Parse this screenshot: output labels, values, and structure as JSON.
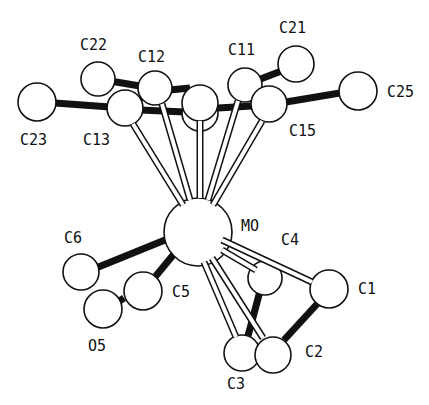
{
  "figure": {
    "type": "ORTEP molecular structure",
    "colors": {
      "ink": "#111111",
      "background": "#ffffff"
    }
  },
  "atoms": [
    {
      "id": "C23",
      "label": "C23",
      "x": 37,
      "y": 102,
      "r": 19,
      "lx": 20,
      "ly": 145
    },
    {
      "id": "C22",
      "label": "C22",
      "x": 98,
      "y": 79,
      "r": 17,
      "lx": 80,
      "ly": 50
    },
    {
      "id": "C12",
      "label": "C12",
      "x": 155,
      "y": 88,
      "r": 17,
      "lx": 138,
      "ly": 62
    },
    {
      "id": "C13",
      "label": "C13",
      "x": 125,
      "y": 108,
      "r": 18,
      "lx": 83,
      "ly": 145
    },
    {
      "id": "C14",
      "label": "",
      "x": 200,
      "y": 103,
      "r": 18,
      "lx": 0,
      "ly": 0
    },
    {
      "id": "C11",
      "label": "C11",
      "x": 245,
      "y": 85,
      "r": 17,
      "lx": 228,
      "ly": 55
    },
    {
      "id": "C21",
      "label": "C21",
      "x": 296,
      "y": 64,
      "r": 18,
      "lx": 279,
      "ly": 33
    },
    {
      "id": "C15",
      "label": "C15",
      "x": 269,
      "y": 104,
      "r": 18,
      "lx": 289,
      "ly": 136
    },
    {
      "id": "C25",
      "label": "C25",
      "x": 358,
      "y": 91,
      "r": 19,
      "lx": 387,
      "ly": 97
    },
    {
      "id": "MO",
      "label": "MO",
      "x": 198,
      "y": 232,
      "r": 34,
      "lx": 241,
      "ly": 231
    },
    {
      "id": "C6",
      "label": "C6",
      "x": 81,
      "y": 272,
      "r": 18,
      "lx": 64,
      "ly": 243
    },
    {
      "id": "C5",
      "label": "C5",
      "x": 143,
      "y": 291,
      "r": 19,
      "lx": 172,
      "ly": 297
    },
    {
      "id": "O5",
      "label": "O5",
      "x": 103,
      "y": 309,
      "r": 19,
      "lx": 88,
      "ly": 351
    },
    {
      "id": "C4",
      "label": "C4",
      "x": 265,
      "y": 278,
      "r": 17,
      "lx": 281,
      "ly": 245
    },
    {
      "id": "C1",
      "label": "C1",
      "x": 329,
      "y": 289,
      "r": 19,
      "lx": 358,
      "ly": 294
    },
    {
      "id": "C3",
      "label": "C3",
      "x": 242,
      "y": 353,
      "r": 18,
      "lx": 227,
      "ly": 389
    },
    {
      "id": "C2",
      "label": "C2",
      "x": 273,
      "y": 355,
      "r": 18,
      "lx": 305,
      "ly": 357
    }
  ],
  "bonds_solid": [
    {
      "from": [
        55,
        103
      ],
      "to": [
        110,
        107
      ]
    },
    {
      "from": [
        110,
        81
      ],
      "to": [
        140,
        86
      ]
    },
    {
      "from": [
        140,
        110
      ],
      "to": [
        185,
        112
      ]
    },
    {
      "from": [
        170,
        90
      ],
      "to": [
        190,
        88
      ]
    },
    {
      "from": [
        218,
        108
      ],
      "to": [
        252,
        106
      ]
    },
    {
      "from": [
        258,
        80
      ],
      "to": [
        284,
        70
      ]
    },
    {
      "from": [
        286,
        102
      ],
      "to": [
        340,
        93
      ]
    },
    {
      "from": [
        143,
        96
      ],
      "to": [
        145,
        100
      ]
    },
    {
      "from": [
        165,
        240
      ],
      "to": [
        96,
        268
      ]
    },
    {
      "from": [
        183,
        243
      ],
      "to": [
        155,
        277
      ]
    },
    {
      "from": [
        124,
        298
      ],
      "to": [
        118,
        302
      ]
    },
    {
      "from": [
        260,
        291
      ],
      "to": [
        248,
        336
      ]
    },
    {
      "from": [
        318,
        303
      ],
      "to": [
        284,
        340
      ]
    }
  ],
  "bonds_open": [
    {
      "from": [
        133,
        124
      ],
      "to": [
        183,
        205
      ]
    },
    {
      "from": [
        162,
        104
      ],
      "to": [
        190,
        200
      ]
    },
    {
      "from": [
        200,
        121
      ],
      "to": [
        200,
        198
      ]
    },
    {
      "from": [
        238,
        101
      ],
      "to": [
        208,
        200
      ]
    },
    {
      "from": [
        262,
        121
      ],
      "to": [
        213,
        205
      ]
    },
    {
      "from": [
        222,
        240
      ],
      "to": [
        312,
        282
      ]
    },
    {
      "from": [
        222,
        250
      ],
      "to": [
        256,
        270
      ]
    },
    {
      "from": [
        204,
        262
      ],
      "to": [
        236,
        337
      ]
    },
    {
      "from": [
        212,
        258
      ],
      "to": [
        263,
        338
      ]
    }
  ],
  "visible_labels": [
    "C22",
    "C12",
    "C11",
    "C21",
    "C23",
    "C13",
    "C15",
    "C25",
    "MO",
    "C4",
    "C6",
    "C5",
    "C1",
    "O5",
    "C2",
    "C3"
  ]
}
